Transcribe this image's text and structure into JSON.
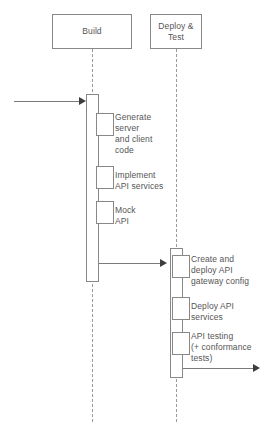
{
  "diagram": {
    "type": "uml-sequence-diagram",
    "title": "",
    "participants": [
      {
        "id": "build",
        "label": "Build"
      },
      {
        "id": "deploy_test",
        "label": "Deploy &\nTest"
      }
    ],
    "messages": [
      {
        "id": "start",
        "label": "",
        "from": "external",
        "to": "build",
        "kind": "incoming-arrow"
      },
      {
        "id": "build_to_deploy",
        "label": "",
        "from": "build",
        "to": "deploy_test",
        "kind": "arrow"
      },
      {
        "id": "end",
        "label": "",
        "from": "deploy_test",
        "to": "external",
        "kind": "outgoing-arrow"
      }
    ],
    "activities": {
      "build": [
        {
          "id": "generate-code",
          "label": "Generate\nserver\nand client\ncode"
        },
        {
          "id": "implement-api-services",
          "label": "Implement\nAPI services"
        },
        {
          "id": "mock-api",
          "label": "Mock\nAPI"
        }
      ],
      "deploy_test": [
        {
          "id": "create-deploy-gateway",
          "label": "Create and\ndeploy API\ngateway config"
        },
        {
          "id": "deploy-api-services",
          "label": "Deploy API\nservices"
        },
        {
          "id": "api-testing",
          "label": "API testing\n(+ conformance\ntests)"
        }
      ]
    },
    "colors": {
      "stroke": "#888888",
      "lifeline": "#9a9a9a",
      "text": "#555555",
      "arrow": "#7a7a7a",
      "arrow_head": "#3d3d3d",
      "background": "#ffffff"
    }
  }
}
